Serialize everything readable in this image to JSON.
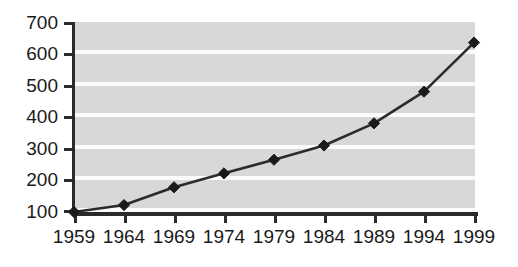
{
  "chart_data": {
    "type": "line",
    "title": "",
    "subtitle": "",
    "xlabel": "",
    "ylabel": "",
    "categories": [
      "1959",
      "1964",
      "1969",
      "1974",
      "1979",
      "1984",
      "1989",
      "1994",
      "1999"
    ],
    "x": [
      1959,
      1964,
      1969,
      1974,
      1979,
      1984,
      1989,
      1994,
      1999
    ],
    "values": [
      100,
      122,
      178,
      222,
      265,
      310,
      380,
      480,
      635
    ],
    "series": [
      {
        "name": "",
        "values": [
          100,
          122,
          178,
          222,
          265,
          310,
          380,
          480,
          635
        ]
      }
    ],
    "ylim": [
      100,
      700
    ],
    "xlim": [
      1959,
      1999
    ],
    "y_ticks": [
      100,
      200,
      300,
      400,
      500,
      600,
      700
    ],
    "y_tick_labels": [
      "100",
      "200",
      "300",
      "400",
      "500",
      "600",
      "700"
    ],
    "x_tick_labels": [
      "1959",
      "1964",
      "1969",
      "1974",
      "1979",
      "1984",
      "1989",
      "1994",
      "1999"
    ],
    "grid": "horizontal",
    "legend": "none",
    "marker": "diamond",
    "annotations": [],
    "colors": {
      "plot_background": "#d8d8d8",
      "gridline": "#fbfbfb",
      "line": "#2b2b2b",
      "marker": "#1a1a1a",
      "axis": "#2b2b2b",
      "tick_label": "#1a1a1a",
      "page_background": "#ffffff"
    }
  }
}
